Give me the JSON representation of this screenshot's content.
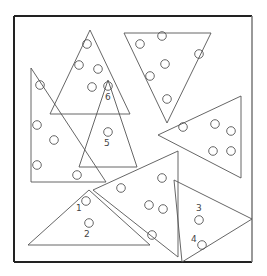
{
  "diagram": {
    "title": "",
    "frame": {
      "x1": 14,
      "y1": 16,
      "x2": 252,
      "y2": 262
    },
    "triangles": [
      {
        "id": "A",
        "points": "90,30 50,114 130,114"
      },
      {
        "id": "B",
        "points": "124,33 211,33 167,123"
      },
      {
        "id": "C",
        "points": "31,68 31,182 106,182"
      },
      {
        "id": "D",
        "points": "108,80 79,167 137,167"
      },
      {
        "id": "E",
        "points": "158,135 241,96 241,178"
      },
      {
        "id": "F",
        "points": "89,190 28,245 150,245"
      },
      {
        "id": "G",
        "points": "93,190 178,151 178,257"
      },
      {
        "id": "H",
        "points": "174,180 252,219 182,262"
      }
    ],
    "circles": [
      {
        "cx": 87,
        "cy": 44
      },
      {
        "cx": 79,
        "cy": 65
      },
      {
        "cx": 98,
        "cy": 69
      },
      {
        "cx": 92,
        "cy": 87
      },
      {
        "cx": 108,
        "cy": 86
      },
      {
        "cx": 40,
        "cy": 85
      },
      {
        "cx": 37,
        "cy": 125
      },
      {
        "cx": 54,
        "cy": 140
      },
      {
        "cx": 37,
        "cy": 165
      },
      {
        "cx": 77,
        "cy": 175
      },
      {
        "cx": 108,
        "cy": 132
      },
      {
        "cx": 162,
        "cy": 36
      },
      {
        "cx": 140,
        "cy": 44
      },
      {
        "cx": 199,
        "cy": 54
      },
      {
        "cx": 165,
        "cy": 64
      },
      {
        "cx": 150,
        "cy": 76
      },
      {
        "cx": 167,
        "cy": 99
      },
      {
        "cx": 183,
        "cy": 127
      },
      {
        "cx": 215,
        "cy": 124
      },
      {
        "cx": 231,
        "cy": 131
      },
      {
        "cx": 213,
        "cy": 151
      },
      {
        "cx": 231,
        "cy": 151
      },
      {
        "cx": 121,
        "cy": 188
      },
      {
        "cx": 162,
        "cy": 178
      },
      {
        "cx": 149,
        "cy": 205
      },
      {
        "cx": 163,
        "cy": 209
      },
      {
        "cx": 152,
        "cy": 235
      },
      {
        "cx": 86,
        "cy": 201
      },
      {
        "cx": 89,
        "cy": 223
      },
      {
        "cx": 199,
        "cy": 220
      },
      {
        "cx": 202,
        "cy": 245
      }
    ],
    "labels": [
      {
        "text": "6",
        "x": 105,
        "y": 100
      },
      {
        "text": "5",
        "x": 104,
        "y": 146
      },
      {
        "text": "1",
        "x": 76,
        "y": 211
      },
      {
        "text": "2",
        "x": 84,
        "y": 237
      },
      {
        "text": "3",
        "x": 196,
        "y": 211
      },
      {
        "text": "4",
        "x": 191,
        "y": 242
      }
    ]
  }
}
